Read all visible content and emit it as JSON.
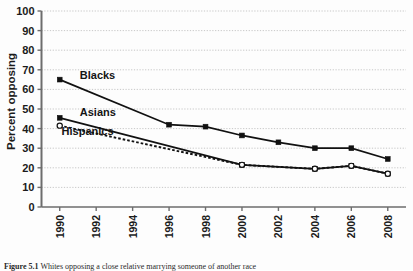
{
  "figure": {
    "caption_prefix": "Figure 5.1",
    "caption_text": "Whites opposing a close relative marrying someone of another race"
  },
  "chart_data": {
    "type": "line",
    "title": "",
    "subtitle": "",
    "xlabel": "",
    "ylabel": "Percent opposing",
    "x": [
      1990,
      1992,
      1994,
      1996,
      1998,
      2000,
      2002,
      2004,
      2006,
      2008
    ],
    "xtick_labels": [
      "1990",
      "1992",
      "1994",
      "1996",
      "1998",
      "2000",
      "2002",
      "2004",
      "2006",
      "2008"
    ],
    "xlim": [
      1989,
      2009
    ],
    "ylim": [
      0,
      100
    ],
    "ytick_labels": [
      "0",
      "10",
      "20",
      "30",
      "40",
      "50",
      "60",
      "70",
      "80",
      "90",
      "100"
    ],
    "yticks": [
      0,
      10,
      20,
      30,
      40,
      50,
      60,
      70,
      80,
      90,
      100
    ],
    "grid": "horizontal-dotted",
    "legend": "inline-annotations",
    "series": [
      {
        "name": "Blacks",
        "label": "Blacks",
        "marker": "filled-square",
        "line_style": "solid",
        "color": "#111111",
        "label_x": 1991.1,
        "label_y": 65.5,
        "values": [
          65,
          null,
          null,
          42,
          41,
          36.5,
          33,
          30,
          30,
          24.5
        ],
        "points": [
          {
            "x": 1990,
            "y": 65
          },
          {
            "x": 1996,
            "y": 42
          },
          {
            "x": 1998,
            "y": 41
          },
          {
            "x": 2000,
            "y": 36.5
          },
          {
            "x": 2002,
            "y": 33
          },
          {
            "x": 2004,
            "y": 30
          },
          {
            "x": 2006,
            "y": 30
          },
          {
            "x": 2008,
            "y": 24.5
          }
        ]
      },
      {
        "name": "Asians",
        "label": "Asians",
        "marker": "filled-square",
        "line_style": "solid",
        "color": "#111111",
        "label_x": 1991.1,
        "label_y": 46.5,
        "values": [
          45.5,
          null,
          null,
          null,
          null,
          21.5,
          null,
          19.5,
          21,
          17
        ],
        "points": [
          {
            "x": 1990,
            "y": 45.5
          },
          {
            "x": 2000,
            "y": 21.5
          },
          {
            "x": 2004,
            "y": 19.5
          },
          {
            "x": 2006,
            "y": 21
          },
          {
            "x": 2008,
            "y": 17
          }
        ]
      },
      {
        "name": "Hispanics",
        "label": "Hispanics",
        "marker": "open-circle",
        "line_style": "dashed",
        "color": "#111111",
        "label_x": 1990.1,
        "label_y": 36.5,
        "values": [
          41.5,
          null,
          null,
          null,
          null,
          21.5,
          null,
          19.5,
          21,
          17
        ],
        "points": [
          {
            "x": 1990,
            "y": 41.5
          },
          {
            "x": 2000,
            "y": 21.5
          },
          {
            "x": 2004,
            "y": 19.5
          },
          {
            "x": 2006,
            "y": 21
          },
          {
            "x": 2008,
            "y": 17
          }
        ]
      }
    ]
  }
}
